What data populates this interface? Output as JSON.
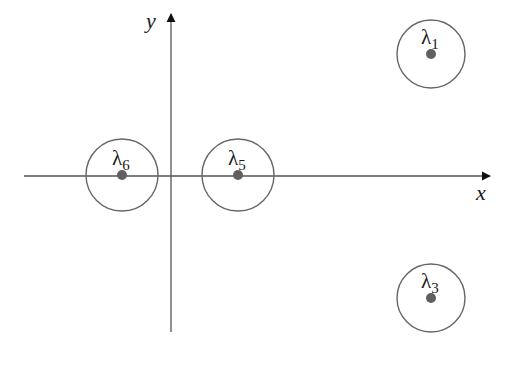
{
  "diagram": {
    "title": "",
    "axes": {
      "x_label": "x",
      "y_label": "y",
      "origin_px": [
        171,
        176
      ],
      "x_axis": {
        "from": 24,
        "to": 492
      },
      "y_axis": {
        "from": 332,
        "to": 12
      }
    },
    "colors": {
      "axis": "#555555",
      "circle": "#666666",
      "point": "#606060",
      "text": "#1a1a1a"
    },
    "eigenvalues": [
      {
        "id": "lambda-6",
        "symbol": "λ",
        "subscript": "6",
        "cx": 122,
        "cy": 175,
        "r": 36
      },
      {
        "id": "lambda-5",
        "symbol": "λ",
        "subscript": "5",
        "cx": 238,
        "cy": 175,
        "r": 36
      },
      {
        "id": "lambda-1",
        "symbol": "λ",
        "subscript": "1",
        "cx": 431,
        "cy": 54,
        "r": 34
      },
      {
        "id": "lambda-3",
        "symbol": "λ",
        "subscript": "3",
        "cx": 431,
        "cy": 298,
        "r": 34
      }
    ]
  }
}
